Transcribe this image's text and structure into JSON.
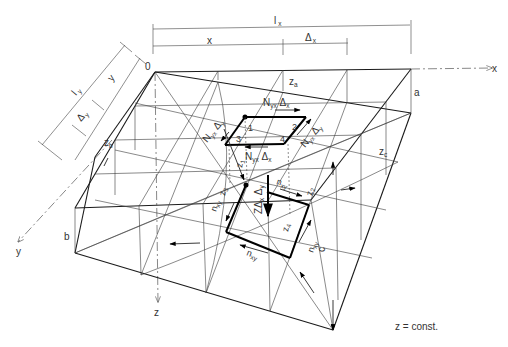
{
  "diagram": {
    "type": "structural-membrane-shell-element",
    "caption": "z = const.",
    "origin_label": "0",
    "axes": {
      "x": "x",
      "y": "y",
      "z": "z"
    },
    "dimensions": {
      "lx": {
        "main": "l",
        "sub": "x"
      },
      "x": "x",
      "dx": {
        "main": "Δ",
        "sub": "x"
      },
      "ly": {
        "main": "l",
        "sub": "y"
      },
      "y": "y",
      "dy": {
        "main": "Δ",
        "sub": "y"
      }
    },
    "heights": {
      "a": "a",
      "b": "b",
      "c": "c",
      "za": {
        "main": "z",
        "sub": "a"
      },
      "zb": {
        "main": "z",
        "sub": "b"
      },
      "zc": {
        "main": "z",
        "sub": "c"
      },
      "z1": {
        "main": "z",
        "sub": "1"
      },
      "z2": {
        "main": "z",
        "sub": "2"
      },
      "z3": {
        "main": "z",
        "sub": "3"
      },
      "z4": {
        "main": "z",
        "sub": "4"
      }
    },
    "corner_numbers": [
      "1",
      "2",
      "3",
      "4"
    ],
    "forces": {
      "nyx_dx_top": {
        "main": "N",
        "sub": "yx",
        "tail": " Δ",
        "tail_sub": "x"
      },
      "nyx_dx_bottom": {
        "main": "N",
        "sub": "yx",
        "tail": " Δ",
        "tail_sub": "x"
      },
      "nyx_dy_left": {
        "main": "N",
        "sub": "yx",
        "tail": " Δ",
        "tail_sub": "y"
      },
      "nyx_dy_right": {
        "main": "N",
        "sub": "yx",
        "tail": " Δ",
        "tail_sub": "y"
      },
      "z_load": {
        "main": "ZΔ",
        "sub": "x",
        "tail": " Δ",
        "tail_sub": "y"
      },
      "nxy_top": {
        "main": "n",
        "sub": "xy"
      },
      "nxy_left": {
        "main": "n",
        "sub": "xy"
      },
      "nxy_bottom": {
        "main": "n",
        "sub": "xy"
      },
      "nxy_right": {
        "main": "n",
        "sub": "xy"
      }
    }
  }
}
